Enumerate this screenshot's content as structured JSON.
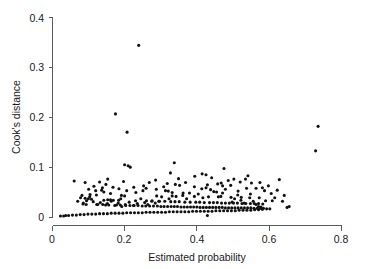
{
  "chart_data": {
    "type": "scatter",
    "title": "",
    "subtitle": "",
    "xlabel": "Estimated probability",
    "ylabel": "Cook's distance",
    "xlim": [
      0,
      0.82
    ],
    "ylim": [
      0,
      0.415
    ],
    "xticks": [
      0,
      0.2,
      0.4,
      0.6,
      0.8
    ],
    "xtick_labels": [
      "0",
      "0.2",
      "0.4",
      "0.6",
      "0.8"
    ],
    "yticks": [
      0,
      0.1,
      0.2,
      0.3,
      0.4
    ],
    "ytick_labels": [
      "0",
      "0.1",
      "0.2",
      "0.3",
      "0.4"
    ],
    "grid": false,
    "legend": null,
    "legend_position": "none",
    "marker": {
      "shape": "circle",
      "color": "#111111",
      "size_px": 3.1,
      "filled": true
    },
    "annotations": [],
    "notable_outliers": [
      {
        "x": 0.246,
        "y": 0.358
      },
      {
        "x": 0.18,
        "y": 0.215
      },
      {
        "x": 0.213,
        "y": 0.177
      },
      {
        "x": 0.755,
        "y": 0.189
      },
      {
        "x": 0.748,
        "y": 0.138
      }
    ],
    "series": [
      {
        "name": "observations",
        "points": [
          [
            0.246,
            0.358
          ],
          [
            0.18,
            0.215
          ],
          [
            0.213,
            0.177
          ],
          [
            0.755,
            0.189
          ],
          [
            0.748,
            0.138
          ],
          [
            0.347,
            0.113
          ],
          [
            0.206,
            0.109
          ],
          [
            0.216,
            0.107
          ],
          [
            0.222,
            0.104
          ],
          [
            0.488,
            0.101
          ],
          [
            0.336,
            0.092
          ],
          [
            0.426,
            0.09
          ],
          [
            0.556,
            0.086
          ],
          [
            0.645,
            0.078
          ],
          [
            0.063,
            0.075
          ],
          [
            0.203,
            0.074
          ],
          [
            0.135,
            0.073
          ],
          [
            0.094,
            0.072
          ],
          [
            0.327,
            0.07
          ],
          [
            0.566,
            0.071
          ],
          [
            0.47,
            0.069
          ],
          [
            0.153,
            0.068
          ],
          [
            0.441,
            0.067
          ],
          [
            0.507,
            0.066
          ],
          [
            0.362,
            0.066
          ],
          [
            0.484,
            0.065
          ],
          [
            0.119,
            0.064
          ],
          [
            0.317,
            0.063
          ],
          [
            0.232,
            0.062
          ],
          [
            0.173,
            0.062
          ],
          [
            0.597,
            0.061
          ],
          [
            0.579,
            0.06
          ],
          [
            0.425,
            0.059
          ],
          [
            0.45,
            0.057
          ],
          [
            0.141,
            0.056
          ],
          [
            0.212,
            0.055
          ],
          [
            0.258,
            0.055
          ],
          [
            0.33,
            0.054
          ],
          [
            0.528,
            0.054
          ],
          [
            0.459,
            0.053
          ],
          [
            0.147,
            0.052
          ],
          [
            0.341,
            0.051
          ],
          [
            0.372,
            0.05
          ],
          [
            0.484,
            0.05
          ],
          [
            0.622,
            0.049
          ],
          [
            0.108,
            0.047
          ],
          [
            0.126,
            0.046
          ],
          [
            0.197,
            0.045
          ],
          [
            0.206,
            0.044
          ],
          [
            0.297,
            0.044
          ],
          [
            0.352,
            0.043
          ],
          [
            0.404,
            0.043
          ],
          [
            0.444,
            0.042
          ],
          [
            0.472,
            0.042
          ],
          [
            0.508,
            0.041
          ],
          [
            0.537,
            0.041
          ],
          [
            0.561,
            0.04
          ],
          [
            0.588,
            0.04
          ],
          [
            0.632,
            0.04
          ],
          [
            0.094,
            0.039
          ],
          [
            0.103,
            0.038
          ],
          [
            0.112,
            0.037
          ],
          [
            0.158,
            0.036
          ],
          [
            0.166,
            0.036
          ],
          [
            0.174,
            0.035
          ],
          [
            0.189,
            0.035
          ],
          [
            0.237,
            0.034
          ],
          [
            0.268,
            0.034
          ],
          [
            0.283,
            0.033
          ],
          [
            0.305,
            0.033
          ],
          [
            0.32,
            0.033
          ],
          [
            0.337,
            0.032
          ],
          [
            0.349,
            0.032
          ],
          [
            0.361,
            0.032
          ],
          [
            0.377,
            0.031
          ],
          [
            0.392,
            0.031
          ],
          [
            0.408,
            0.031
          ],
          [
            0.419,
            0.031
          ],
          [
            0.432,
            0.03
          ],
          [
            0.447,
            0.03
          ],
          [
            0.458,
            0.03
          ],
          [
            0.469,
            0.03
          ],
          [
            0.481,
            0.029
          ],
          [
            0.492,
            0.029
          ],
          [
            0.503,
            0.029
          ],
          [
            0.515,
            0.029
          ],
          [
            0.526,
            0.029
          ],
          [
            0.539,
            0.028
          ],
          [
            0.55,
            0.028
          ],
          [
            0.563,
            0.028
          ],
          [
            0.574,
            0.028
          ],
          [
            0.586,
            0.028
          ],
          [
            0.598,
            0.027
          ],
          [
            0.088,
            0.027
          ],
          [
            0.097,
            0.026
          ],
          [
            0.13,
            0.026
          ],
          [
            0.144,
            0.026
          ],
          [
            0.152,
            0.025
          ],
          [
            0.161,
            0.025
          ],
          [
            0.183,
            0.025
          ],
          [
            0.194,
            0.025
          ],
          [
            0.209,
            0.024
          ],
          [
            0.221,
            0.024
          ],
          [
            0.233,
            0.024
          ],
          [
            0.244,
            0.024
          ],
          [
            0.256,
            0.023
          ],
          [
            0.266,
            0.023
          ],
          [
            0.277,
            0.023
          ],
          [
            0.288,
            0.023
          ],
          [
            0.299,
            0.023
          ],
          [
            0.309,
            0.022
          ],
          [
            0.318,
            0.022
          ],
          [
            0.328,
            0.022
          ],
          [
            0.338,
            0.022
          ],
          [
            0.347,
            0.022
          ],
          [
            0.356,
            0.022
          ],
          [
            0.366,
            0.021
          ],
          [
            0.375,
            0.021
          ],
          [
            0.384,
            0.021
          ],
          [
            0.393,
            0.021
          ],
          [
            0.402,
            0.021
          ],
          [
            0.411,
            0.021
          ],
          [
            0.42,
            0.02
          ],
          [
            0.429,
            0.02
          ],
          [
            0.438,
            0.02
          ],
          [
            0.447,
            0.02
          ],
          [
            0.456,
            0.02
          ],
          [
            0.465,
            0.02
          ],
          [
            0.474,
            0.02
          ],
          [
            0.483,
            0.02
          ],
          [
            0.492,
            0.019
          ],
          [
            0.501,
            0.019
          ],
          [
            0.51,
            0.019
          ],
          [
            0.519,
            0.019
          ],
          [
            0.528,
            0.019
          ],
          [
            0.537,
            0.019
          ],
          [
            0.546,
            0.019
          ],
          [
            0.555,
            0.019
          ],
          [
            0.564,
            0.019
          ],
          [
            0.573,
            0.018
          ],
          [
            0.582,
            0.018
          ],
          [
            0.591,
            0.018
          ],
          [
            0.6,
            0.018
          ],
          [
            0.609,
            0.017
          ],
          [
            0.618,
            0.017
          ],
          [
            0.597,
            0.016
          ],
          [
            0.586,
            0.015
          ],
          [
            0.575,
            0.015
          ],
          [
            0.564,
            0.014
          ],
          [
            0.553,
            0.014
          ],
          [
            0.542,
            0.014
          ],
          [
            0.531,
            0.014
          ],
          [
            0.52,
            0.013
          ],
          [
            0.509,
            0.013
          ],
          [
            0.498,
            0.013
          ],
          [
            0.487,
            0.013
          ],
          [
            0.476,
            0.013
          ],
          [
            0.465,
            0.013
          ],
          [
            0.454,
            0.012
          ],
          [
            0.443,
            0.012
          ],
          [
            0.432,
            0.012
          ],
          [
            0.421,
            0.012
          ],
          [
            0.41,
            0.012
          ],
          [
            0.399,
            0.012
          ],
          [
            0.388,
            0.011
          ],
          [
            0.377,
            0.011
          ],
          [
            0.366,
            0.011
          ],
          [
            0.355,
            0.011
          ],
          [
            0.344,
            0.011
          ],
          [
            0.333,
            0.011
          ],
          [
            0.322,
            0.01
          ],
          [
            0.311,
            0.01
          ],
          [
            0.3,
            0.01
          ],
          [
            0.289,
            0.01
          ],
          [
            0.278,
            0.01
          ],
          [
            0.267,
            0.01
          ],
          [
            0.256,
            0.009
          ],
          [
            0.245,
            0.009
          ],
          [
            0.234,
            0.009
          ],
          [
            0.223,
            0.009
          ],
          [
            0.212,
            0.009
          ],
          [
            0.201,
            0.008
          ],
          [
            0.19,
            0.008
          ],
          [
            0.179,
            0.008
          ],
          [
            0.168,
            0.008
          ],
          [
            0.157,
            0.007
          ],
          [
            0.146,
            0.007
          ],
          [
            0.135,
            0.007
          ],
          [
            0.124,
            0.006
          ],
          [
            0.113,
            0.006
          ],
          [
            0.102,
            0.006
          ],
          [
            0.091,
            0.005
          ],
          [
            0.08,
            0.005
          ],
          [
            0.069,
            0.004
          ],
          [
            0.058,
            0.004
          ],
          [
            0.047,
            0.003
          ],
          [
            0.039,
            0.003
          ],
          [
            0.033,
            0.002
          ],
          [
            0.024,
            0.002
          ],
          [
            0.441,
            0.003
          ],
          [
            0.673,
            0.022
          ],
          [
            0.667,
            0.02
          ],
          [
            0.659,
            0.045
          ],
          [
            0.654,
            0.033
          ],
          [
            0.639,
            0.056
          ],
          [
            0.614,
            0.065
          ],
          [
            0.606,
            0.034
          ],
          [
            0.593,
            0.021
          ],
          [
            0.586,
            0.022
          ],
          [
            0.579,
            0.026
          ],
          [
            0.571,
            0.033
          ],
          [
            0.563,
            0.048
          ],
          [
            0.552,
            0.06
          ],
          [
            0.545,
            0.029
          ],
          [
            0.536,
            0.035
          ],
          [
            0.527,
            0.046
          ],
          [
            0.518,
            0.038
          ],
          [
            0.511,
            0.031
          ],
          [
            0.5,
            0.076
          ],
          [
            0.492,
            0.058
          ],
          [
            0.479,
            0.043
          ],
          [
            0.467,
            0.052
          ],
          [
            0.453,
            0.082
          ],
          [
            0.437,
            0.061
          ],
          [
            0.428,
            0.04
          ],
          [
            0.415,
            0.048
          ],
          [
            0.404,
            0.063
          ],
          [
            0.39,
            0.05
          ],
          [
            0.382,
            0.038
          ],
          [
            0.371,
            0.045
          ],
          [
            0.359,
            0.08
          ],
          [
            0.35,
            0.068
          ],
          [
            0.341,
            0.044
          ],
          [
            0.332,
            0.038
          ],
          [
            0.322,
            0.055
          ],
          [
            0.311,
            0.042
          ],
          [
            0.303,
            0.033
          ],
          [
            0.293,
            0.029
          ],
          [
            0.284,
            0.034
          ],
          [
            0.272,
            0.026
          ],
          [
            0.263,
            0.03
          ],
          [
            0.252,
            0.038
          ],
          [
            0.242,
            0.028
          ],
          [
            0.231,
            0.024
          ],
          [
            0.219,
            0.031
          ],
          [
            0.208,
            0.026
          ],
          [
            0.198,
            0.022
          ],
          [
            0.188,
            0.029
          ],
          [
            0.178,
            0.024
          ],
          [
            0.168,
            0.033
          ],
          [
            0.157,
            0.028
          ],
          [
            0.147,
            0.035
          ],
          [
            0.137,
            0.03
          ],
          [
            0.127,
            0.026
          ],
          [
            0.117,
            0.032
          ],
          [
            0.107,
            0.042
          ],
          [
            0.098,
            0.034
          ],
          [
            0.089,
            0.029
          ],
          [
            0.081,
            0.04
          ],
          [
            0.073,
            0.033
          ],
          [
            0.296,
            0.058
          ],
          [
            0.267,
            0.06
          ],
          [
            0.238,
            0.051
          ],
          [
            0.195,
            0.038
          ],
          [
            0.166,
            0.049
          ],
          [
            0.124,
            0.055
          ],
          [
            0.104,
            0.058
          ],
          [
            0.085,
            0.045
          ],
          [
            0.48,
            0.071
          ],
          [
            0.516,
            0.079
          ],
          [
            0.534,
            0.073
          ],
          [
            0.549,
            0.079
          ],
          [
            0.59,
            0.072
          ],
          [
            0.603,
            0.055
          ],
          [
            0.625,
            0.034
          ],
          [
            0.437,
            0.088
          ],
          [
            0.405,
            0.085
          ],
          [
            0.379,
            0.072
          ],
          [
            0.294,
            0.077
          ],
          [
            0.276,
            0.072
          ],
          [
            0.26,
            0.065
          ],
          [
            0.158,
            0.079
          ],
          [
            0.143,
            0.061
          ],
          [
            0.19,
            0.059
          ]
        ]
      }
    ]
  },
  "axes": {
    "x_tick_positions_px": [
      52,
      124,
      197,
      269,
      341
    ],
    "y_tick_positions_px": [
      217,
      167,
      117,
      68,
      18
    ]
  }
}
